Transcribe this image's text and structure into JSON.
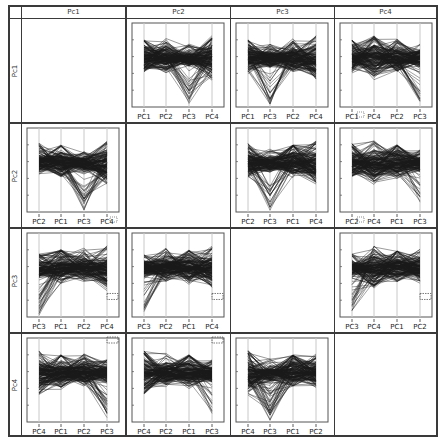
{
  "chart_data": {
    "type": "parallel_coordinates_matrix",
    "title": "",
    "grid": {
      "rows": 4,
      "cols": 4
    },
    "column_headers": [
      "Pc1",
      "Pc2",
      "Pc3",
      "Pc4"
    ],
    "row_headers": [
      "Pc1",
      "Pc2",
      "Pc3",
      "Pc4"
    ],
    "diagonal_empty": true,
    "line_color": "#1a1a1a",
    "axis_line_color": "#c8c8c8",
    "frame_color": "#555555",
    "axis_profiles": {
      "PC1": {
        "top": 0.22,
        "bottom": 0.62,
        "dip": 0.0,
        "peak": 0.2
      },
      "PC2": {
        "top": 0.25,
        "bottom": 0.6,
        "dip": 0.0,
        "peak": 0.18
      },
      "PC3": {
        "top": 0.3,
        "bottom": 0.55,
        "dip": 0.98,
        "peak": 0.25
      },
      "PC4": {
        "top": 0.2,
        "bottom": 0.7,
        "dip": 0.0,
        "peak": 0.15
      }
    },
    "cells": [
      {
        "row": 0,
        "col": 0,
        "axes": []
      },
      {
        "row": 0,
        "col": 1,
        "axes": [
          "PC1",
          "PC2",
          "PC3",
          "PC4"
        ]
      },
      {
        "row": 0,
        "col": 2,
        "axes": [
          "PC1",
          "PC3",
          "PC2",
          "PC4"
        ]
      },
      {
        "row": 0,
        "col": 3,
        "axes": [
          "PC1",
          "PC4",
          "PC2",
          "PC3"
        ],
        "marker": "near-first-label"
      },
      {
        "row": 1,
        "col": 0,
        "axes": [
          "PC2",
          "PC1",
          "PC3",
          "PC4"
        ],
        "marker": "near-last-label"
      },
      {
        "row": 1,
        "col": 1,
        "axes": []
      },
      {
        "row": 1,
        "col": 2,
        "axes": [
          "PC2",
          "PC3",
          "PC1",
          "PC4"
        ]
      },
      {
        "row": 1,
        "col": 3,
        "axes": [
          "PC2",
          "PC4",
          "PC1",
          "PC3"
        ],
        "marker": "near-first-label"
      },
      {
        "row": 2,
        "col": 0,
        "axes": [
          "PC3",
          "PC1",
          "PC2",
          "PC4"
        ],
        "marker": "dashed-box"
      },
      {
        "row": 2,
        "col": 1,
        "axes": [
          "PC3",
          "PC2",
          "PC1",
          "PC4"
        ],
        "marker": "dashed-box"
      },
      {
        "row": 2,
        "col": 2,
        "axes": []
      },
      {
        "row": 2,
        "col": 3,
        "axes": [
          "PC3",
          "PC4",
          "PC1",
          "PC2"
        ],
        "marker": "dashed-box"
      },
      {
        "row": 3,
        "col": 0,
        "axes": [
          "PC4",
          "PC1",
          "PC2",
          "PC3"
        ],
        "marker": "dashed-box-top"
      },
      {
        "row": 3,
        "col": 1,
        "axes": [
          "PC4",
          "PC2",
          "PC1",
          "PC3"
        ],
        "marker": "dashed-box-top"
      },
      {
        "row": 3,
        "col": 2,
        "axes": [
          "PC4",
          "PC3",
          "PC1",
          "PC2"
        ]
      },
      {
        "row": 3,
        "col": 3,
        "axes": []
      }
    ],
    "xlabel": "",
    "ylabel": "",
    "legend": null
  }
}
